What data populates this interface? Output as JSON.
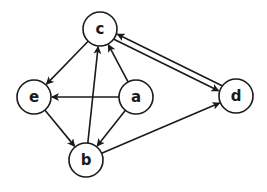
{
  "diagram": {
    "type": "directed-graph",
    "nodes": [
      {
        "id": "c",
        "label": "c",
        "x": 100,
        "y": 29
      },
      {
        "id": "e",
        "label": "e",
        "x": 34,
        "y": 97
      },
      {
        "id": "a",
        "label": "a",
        "x": 136,
        "y": 97
      },
      {
        "id": "d",
        "label": "d",
        "x": 236,
        "y": 96
      },
      {
        "id": "b",
        "label": "b",
        "x": 86,
        "y": 160
      }
    ],
    "edges": [
      {
        "from": "c",
        "to": "e"
      },
      {
        "from": "c",
        "to": "d"
      },
      {
        "from": "d",
        "to": "c"
      },
      {
        "from": "a",
        "to": "c"
      },
      {
        "from": "a",
        "to": "e"
      },
      {
        "from": "a",
        "to": "b"
      },
      {
        "from": "e",
        "to": "b"
      },
      {
        "from": "b",
        "to": "c"
      },
      {
        "from": "b",
        "to": "d"
      }
    ],
    "colors": {
      "stroke": "#1a1a1a",
      "fill": "#ffffff"
    }
  }
}
